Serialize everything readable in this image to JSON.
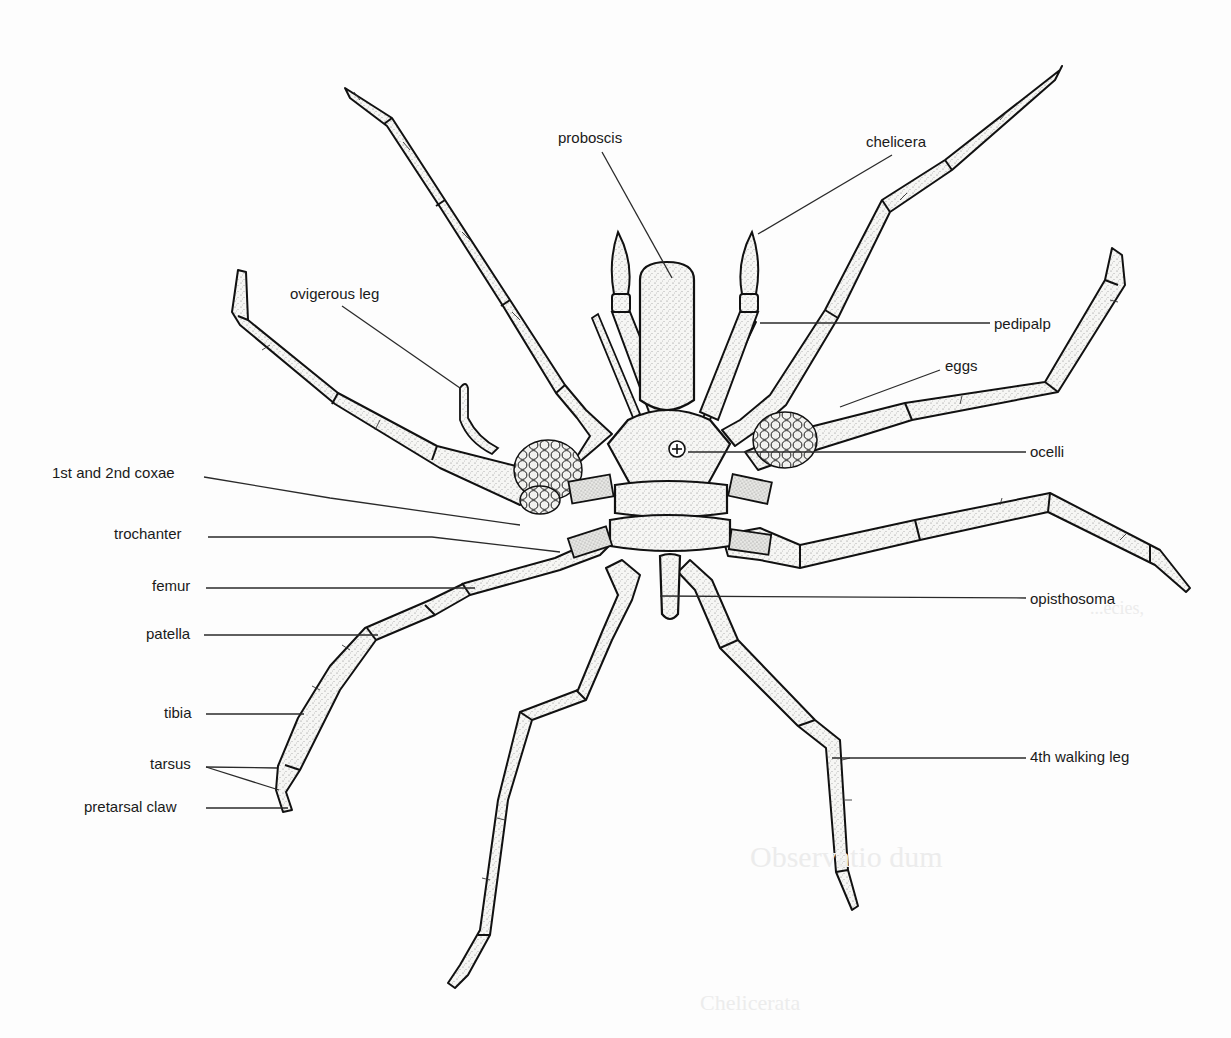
{
  "figure": {
    "colors": {
      "ink": "#1a1a1a",
      "leader": "#2a2a2a",
      "fill": "#f4f4f2",
      "stipple": "#8a8a8a",
      "background": "#fdfdfd",
      "bleed_text": "#e8e8e8"
    },
    "labels": [
      {
        "id": "proboscis",
        "text": "proboscis",
        "x": 558,
        "y": 130,
        "anchor": "left",
        "leader": [
          [
            602,
            152
          ],
          [
            672,
            278
          ]
        ]
      },
      {
        "id": "chelicera",
        "text": "chelicera",
        "x": 866,
        "y": 134,
        "anchor": "left",
        "leader": [
          [
            892,
            155
          ],
          [
            758,
            234
          ]
        ]
      },
      {
        "id": "ovigerous-leg",
        "text": "ovigerous leg",
        "x": 290,
        "y": 286,
        "anchor": "left",
        "leader": [
          [
            342,
            306
          ],
          [
            460,
            388
          ]
        ]
      },
      {
        "id": "pedipalp",
        "text": "pedipalp",
        "x": 994,
        "y": 316,
        "anchor": "left",
        "leader": [
          [
            990,
            323
          ],
          [
            760,
            323
          ]
        ]
      },
      {
        "id": "eggs",
        "text": "eggs",
        "x": 945,
        "y": 358,
        "anchor": "left",
        "leader": [
          [
            940,
            370
          ],
          [
            840,
            407
          ]
        ]
      },
      {
        "id": "ocelli",
        "text": "ocelli",
        "x": 1030,
        "y": 444,
        "anchor": "left",
        "leader": [
          [
            1026,
            452
          ],
          [
            688,
            452
          ]
        ]
      },
      {
        "id": "1st-and-2nd-coxae",
        "text": "1st and 2nd coxae",
        "x": 52,
        "y": 465,
        "anchor": "left",
        "leader": [
          [
            204,
            477
          ],
          [
            330,
            498
          ],
          [
            520,
            525
          ]
        ]
      },
      {
        "id": "trochanter",
        "text": "trochanter",
        "x": 114,
        "y": 526,
        "anchor": "left",
        "leader": [
          [
            208,
            537
          ],
          [
            432,
            537
          ],
          [
            560,
            552
          ]
        ]
      },
      {
        "id": "femur",
        "text": "femur",
        "x": 152,
        "y": 578,
        "anchor": "left",
        "leader": [
          [
            206,
            588
          ],
          [
            475,
            588
          ]
        ]
      },
      {
        "id": "patella",
        "text": "patella",
        "x": 146,
        "y": 626,
        "anchor": "left",
        "leader": [
          [
            204,
            635
          ],
          [
            378,
            635
          ]
        ]
      },
      {
        "id": "tibia",
        "text": "tibia",
        "x": 164,
        "y": 705,
        "anchor": "left",
        "leader": [
          [
            206,
            714
          ],
          [
            304,
            714
          ]
        ]
      },
      {
        "id": "tarsus",
        "text": "tarsus",
        "x": 150,
        "y": 756,
        "anchor": "left",
        "leader_fork": [
          [
            [
              206,
              767
            ],
            [
              277,
              768
            ]
          ],
          [
            [
              206,
              767
            ],
            [
              279,
              790
            ]
          ]
        ]
      },
      {
        "id": "pretarsal-claw",
        "text": "pretarsal claw",
        "x": 84,
        "y": 799,
        "anchor": "left",
        "leader": [
          [
            206,
            808
          ],
          [
            288,
            808
          ]
        ]
      },
      {
        "id": "opisthosoma",
        "text": "opisthosoma",
        "x": 1030,
        "y": 591,
        "anchor": "left",
        "leader": [
          [
            1026,
            598
          ],
          [
            660,
            596
          ]
        ]
      },
      {
        "id": "4th-walking-leg",
        "text": "4th walking leg",
        "x": 1030,
        "y": 749,
        "anchor": "left",
        "leader": [
          [
            1026,
            758
          ],
          [
            832,
            758
          ]
        ]
      }
    ],
    "bleed_through_text": [
      {
        "text": "...ecies,",
        "x": 1090,
        "y": 598,
        "size": 18
      },
      {
        "text": "Observatio      dum",
        "x": 750,
        "y": 862,
        "size": 30
      },
      {
        "text": "Chelicerata",
        "x": 700,
        "y": 1005,
        "size": 22
      }
    ]
  }
}
